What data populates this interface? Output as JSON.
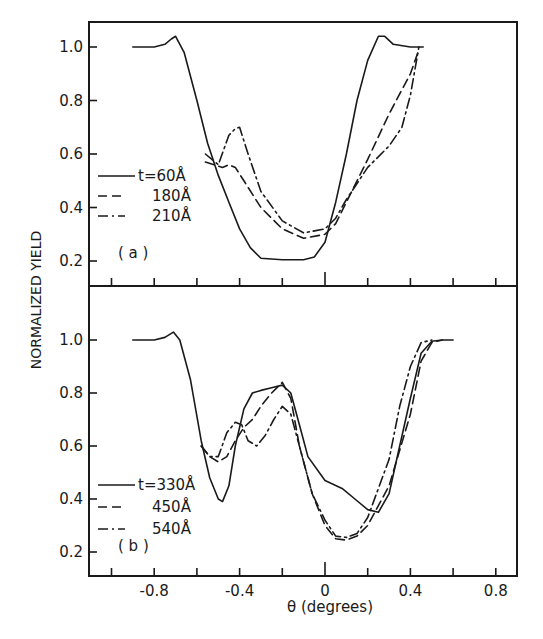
{
  "chart_data": [
    {
      "type": "line",
      "panel": "(a)",
      "title": "",
      "xlabel": "θ (degrees)",
      "ylabel": "NORMALIZED YIELD",
      "xlim": [
        -1.1,
        0.9
      ],
      "ylim": [
        0.1,
        1.1
      ],
      "yticks": [
        "0.2",
        "0.4",
        "0.6",
        "0.8",
        "1.0"
      ],
      "grid": false,
      "legend_position": "left-middle",
      "series": [
        {
          "name": "t=60Å",
          "style": "solid",
          "x": [
            -0.9,
            -0.8,
            -0.75,
            -0.72,
            -0.7,
            -0.66,
            -0.6,
            -0.55,
            -0.5,
            -0.45,
            -0.4,
            -0.35,
            -0.3,
            -0.2,
            -0.1,
            -0.05,
            0.0,
            0.05,
            0.1,
            0.15,
            0.2,
            0.25,
            0.28,
            0.32,
            0.4,
            0.46
          ],
          "y": [
            1.0,
            1.0,
            1.01,
            1.03,
            1.04,
            0.98,
            0.8,
            0.64,
            0.52,
            0.42,
            0.32,
            0.25,
            0.21,
            0.205,
            0.205,
            0.215,
            0.27,
            0.42,
            0.6,
            0.8,
            0.95,
            1.04,
            1.04,
            1.01,
            1.0,
            1.0
          ]
        },
        {
          "name": "180Å",
          "style": "dashed",
          "x": [
            -0.56,
            -0.52,
            -0.48,
            -0.45,
            -0.42,
            -0.38,
            -0.3,
            -0.2,
            -0.1,
            0.0,
            0.05,
            0.1,
            0.2,
            0.3,
            0.4,
            0.44
          ],
          "y": [
            0.57,
            0.56,
            0.55,
            0.56,
            0.55,
            0.5,
            0.4,
            0.32,
            0.285,
            0.3,
            0.34,
            0.42,
            0.58,
            0.75,
            0.9,
            0.99
          ]
        },
        {
          "name": "210Å",
          "style": "dash-dot",
          "x": [
            -0.56,
            -0.5,
            -0.45,
            -0.42,
            -0.4,
            -0.36,
            -0.3,
            -0.2,
            -0.1,
            0.0,
            0.05,
            0.1,
            0.2,
            0.3,
            0.36,
            0.4,
            0.44
          ],
          "y": [
            0.6,
            0.56,
            0.67,
            0.695,
            0.7,
            0.6,
            0.46,
            0.35,
            0.305,
            0.32,
            0.36,
            0.43,
            0.55,
            0.63,
            0.7,
            0.82,
            1.0
          ]
        }
      ]
    },
    {
      "type": "line",
      "panel": "(b)",
      "title": "",
      "xlabel": "θ (degrees)",
      "ylabel": "NORMALIZED YIELD",
      "xlim": [
        -1.1,
        0.9
      ],
      "ylim": [
        0.1,
        1.1
      ],
      "xticks": [
        "-0.8",
        "-0.4",
        "0",
        "0.4",
        "0.8"
      ],
      "yticks": [
        "0.2",
        "0.4",
        "0.6",
        "0.8",
        "1.0"
      ],
      "grid": false,
      "legend_position": "left-lower",
      "series": [
        {
          "name": "t=330Å",
          "style": "solid",
          "x": [
            -0.9,
            -0.8,
            -0.75,
            -0.71,
            -0.68,
            -0.63,
            -0.58,
            -0.54,
            -0.5,
            -0.48,
            -0.45,
            -0.42,
            -0.38,
            -0.34,
            -0.3,
            -0.25,
            -0.2,
            -0.16,
            -0.12,
            -0.08,
            0.0,
            0.08,
            0.14,
            0.2,
            0.25,
            0.3,
            0.35,
            0.4,
            0.45,
            0.5,
            0.55,
            0.6
          ],
          "y": [
            1.0,
            1.0,
            1.01,
            1.03,
            1.0,
            0.85,
            0.62,
            0.48,
            0.4,
            0.39,
            0.45,
            0.6,
            0.74,
            0.8,
            0.81,
            0.82,
            0.83,
            0.8,
            0.68,
            0.56,
            0.47,
            0.44,
            0.4,
            0.36,
            0.35,
            0.42,
            0.6,
            0.78,
            0.95,
            0.995,
            1.0,
            1.0
          ]
        },
        {
          "name": "450Å",
          "style": "dashed",
          "x": [
            -0.58,
            -0.54,
            -0.5,
            -0.46,
            -0.42,
            -0.38,
            -0.34,
            -0.3,
            -0.25,
            -0.2,
            -0.16,
            -0.12,
            -0.06,
            0.0,
            0.05,
            0.1,
            0.15,
            0.2,
            0.3,
            0.4,
            0.45,
            0.5,
            0.55
          ],
          "y": [
            0.6,
            0.56,
            0.54,
            0.56,
            0.62,
            0.67,
            0.7,
            0.75,
            0.8,
            0.84,
            0.78,
            0.6,
            0.42,
            0.3,
            0.25,
            0.245,
            0.26,
            0.3,
            0.45,
            0.72,
            0.92,
            0.99,
            1.0
          ]
        },
        {
          "name": "540Å",
          "style": "dash-dot",
          "x": [
            -0.58,
            -0.54,
            -0.5,
            -0.46,
            -0.42,
            -0.39,
            -0.36,
            -0.32,
            -0.28,
            -0.24,
            -0.2,
            -0.16,
            -0.12,
            -0.06,
            0.0,
            0.05,
            0.1,
            0.15,
            0.2,
            0.3,
            0.35,
            0.4,
            0.45,
            0.5
          ],
          "y": [
            0.6,
            0.56,
            0.56,
            0.65,
            0.69,
            0.68,
            0.62,
            0.6,
            0.64,
            0.7,
            0.75,
            0.72,
            0.6,
            0.42,
            0.32,
            0.26,
            0.255,
            0.27,
            0.33,
            0.55,
            0.75,
            0.9,
            0.99,
            1.0
          ]
        }
      ]
    }
  ],
  "labels": {
    "ylabel": "NORMALIZED YIELD",
    "xlabel": "θ (degrees)",
    "panel_a": "( a )",
    "panel_b": "( b )",
    "ytick_labels": [
      "1.0",
      "0.8",
      "0.6",
      "0.4",
      "0.2"
    ],
    "xtick_labels": [
      "-0.8",
      "-0.4",
      "0",
      "0.4",
      "0.8"
    ],
    "legend_a": [
      "t=60Å",
      "180Å",
      "210Å"
    ],
    "legend_b": [
      "t=330Å",
      "450Å",
      "540Å"
    ]
  }
}
